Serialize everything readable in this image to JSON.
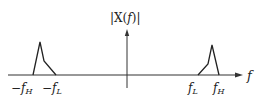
{
  "diagram": {
    "title": "|X(f)|",
    "title_parts": {
      "pre": "|X(",
      "var": "f",
      "post": ")|"
    },
    "x_axis_label": "f",
    "ticks": [
      {
        "id": "neg-fH",
        "sign": "−",
        "base": "f",
        "sub": "H",
        "x": 17
      },
      {
        "id": "neg-fL",
        "sign": "−",
        "base": "f",
        "sub": "L",
        "x": 48
      },
      {
        "id": "pos-fL",
        "sign": "",
        "base": "f",
        "sub": "L",
        "x": 190
      },
      {
        "id": "pos-fH",
        "sign": "",
        "base": "f",
        "sub": "H",
        "x": 215
      }
    ],
    "spectrum": {
      "left_band": "-fH to -fL",
      "right_band": "fL to fH",
      "description": "Bandpass magnitude spectrum, symmetric about f=0, peaks near ±fH"
    },
    "colors": {
      "line": "#222222",
      "axis": "#333333"
    }
  }
}
